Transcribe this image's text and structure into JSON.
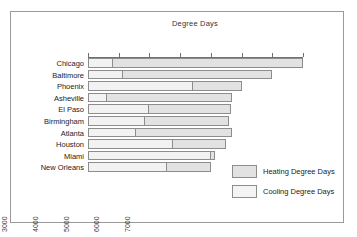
{
  "chart_data": {
    "type": "bar",
    "orientation": "horizontal",
    "stacked": true,
    "title": "Degree Days",
    "xlabel": "Degree Days",
    "ylabel": "",
    "xlim": [
      0,
      7000
    ],
    "grid": false,
    "legend_position": "bottom-right",
    "axis_position": "top",
    "tick_labels": [
      "0",
      "1000",
      "2000",
      "3000",
      "4000",
      "5000",
      "6000",
      "7000"
    ],
    "ticks": [
      0,
      1000,
      2000,
      3000,
      4000,
      5000,
      6000,
      7000
    ],
    "categories": [
      "Chicago",
      "Baltimore",
      "Phoenix",
      "Asheville",
      "El Paso",
      "Birmingham",
      "Atlanta",
      "Houston",
      "Miami",
      "New Orleans"
    ],
    "series": [
      {
        "name": "Cooling Degree Days",
        "color": "#f2f2f2",
        "values": [
          830,
          1130,
          3410,
          620,
          2000,
          1850,
          1560,
          2760,
          3990,
          2580
        ]
      },
      {
        "name": "Heating Degree Days",
        "color": "#e2e2e2",
        "values": [
          6170,
          4870,
          1590,
          4080,
          2650,
          2750,
          3120,
          1740,
          160,
          1420
        ]
      }
    ],
    "totals": [
      7000,
      6000,
      5000,
      4700,
      4650,
      4600,
      4680,
      4500,
      4150,
      4000
    ]
  },
  "legend": {
    "items": [
      {
        "label": "Heating Degree Days",
        "swatch": "heating"
      },
      {
        "label": "Cooling Degree Days",
        "swatch": "cooling"
      }
    ]
  }
}
